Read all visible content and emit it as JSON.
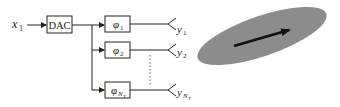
{
  "diagram": {
    "input": {
      "main": "x",
      "sub": "1"
    },
    "dac_label": "DAC",
    "phase_shifters": [
      {
        "symbol": "φ",
        "sub": "1"
      },
      {
        "symbol": "φ",
        "sub": "2"
      },
      {
        "symbol": "φ",
        "sub": "N",
        "subsub": "T"
      }
    ],
    "outputs": [
      {
        "main": "y",
        "sub": "1"
      },
      {
        "main": "y",
        "sub": "2"
      },
      {
        "main": "y",
        "sub": "N",
        "subsub": "T"
      }
    ],
    "beam": {
      "shape": "ellipse",
      "fill": "#8c8c8c",
      "arrow_color": "#111111"
    }
  }
}
